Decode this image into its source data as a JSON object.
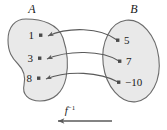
{
  "diagram": {
    "type": "mapping-diagram",
    "title": "",
    "sets": [
      {
        "id": "A",
        "label": "A",
        "shape": "bean",
        "fill_color": "#e9e9e9",
        "stroke_color": "#6b6b6b",
        "elements": [
          {
            "value": "1",
            "label_side": "left"
          },
          {
            "value": "3",
            "label_side": "left"
          },
          {
            "value": "8",
            "label_side": "left"
          }
        ]
      },
      {
        "id": "B",
        "label": "B",
        "shape": "ellipse",
        "fill_color": "#e9e9e9",
        "stroke_color": "#6b6b6b",
        "elements": [
          {
            "value": "5",
            "label_side": "right"
          },
          {
            "value": "7",
            "label_side": "right"
          },
          {
            "value": "−10",
            "label_side": "right"
          }
        ]
      }
    ],
    "mappings": [
      {
        "from": "5",
        "to": "1",
        "direction": "B-to-A",
        "curve": "arc-up"
      },
      {
        "from": "7",
        "to": "3",
        "direction": "B-to-A",
        "curve": "arc-up"
      },
      {
        "from": "−10",
        "to": "8",
        "direction": "B-to-A",
        "curve": "arc-up"
      }
    ],
    "function_label": {
      "base": "f",
      "superscript": "−1",
      "full": "f⁻¹"
    },
    "direction_arrow": {
      "points": "left",
      "from_set": "B",
      "to_set": "A"
    },
    "colors": {
      "set_fill": "#e9e9e9",
      "set_stroke": "#6b6b6b",
      "arrow_stroke": "#5a5a5a",
      "dot": "#4a4a4a",
      "text": "#1a1a1a",
      "background": "#ffffff"
    }
  }
}
